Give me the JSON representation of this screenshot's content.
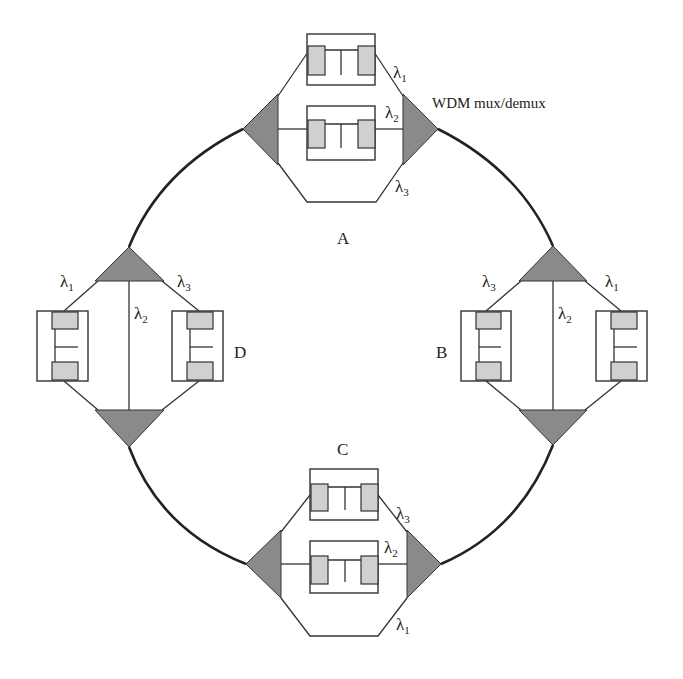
{
  "diagram": {
    "type": "WDM ring network with add/drop nodes",
    "mux_label": "WDM mux/demux",
    "nodes": [
      {
        "id": "A",
        "label": "A",
        "position": "top",
        "channels": [
          "λ1",
          "λ2",
          "λ3"
        ],
        "dropped": [
          "λ1",
          "λ2"
        ],
        "passthrough": "λ3"
      },
      {
        "id": "B",
        "label": "B",
        "position": "right",
        "channels": [
          "λ3",
          "λ2",
          "λ1"
        ],
        "dropped": [
          "λ3",
          "λ1"
        ],
        "passthrough": "λ2"
      },
      {
        "id": "C",
        "label": "C",
        "position": "bottom",
        "channels": [
          "λ3",
          "λ2",
          "λ1"
        ],
        "dropped": [
          "λ3",
          "λ2"
        ],
        "passthrough": "λ1"
      },
      {
        "id": "D",
        "label": "D",
        "position": "left",
        "channels": [
          "λ1",
          "λ2",
          "λ3"
        ],
        "dropped": [
          "λ1",
          "λ3"
        ],
        "passthrough": "λ2"
      }
    ],
    "lambda_symbol": "λ",
    "subscripts": {
      "one": "1",
      "two": "2",
      "three": "3"
    }
  },
  "colors": {
    "mux_fill": "#8a8a8a",
    "cell_fill": "#d0d0d0",
    "line": "#333333"
  }
}
